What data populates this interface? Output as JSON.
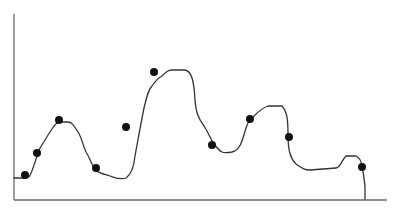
{
  "chart_data": {
    "type": "line",
    "title": "",
    "xlabel": "",
    "ylabel": "",
    "grid": false,
    "legend": null,
    "axis_ticks": false,
    "xlim": [
      0,
      373
    ],
    "ylim": [
      0,
      186
    ],
    "colors": {
      "line": "#333333",
      "points": "#111111",
      "axis": "#6b6b6b"
    },
    "line_series": {
      "name": "smooth curve",
      "x": [
        0,
        10,
        16,
        20,
        24,
        28,
        36,
        42,
        48,
        56,
        62,
        68,
        75,
        80,
        86,
        92,
        100,
        108,
        114,
        118,
        122,
        126,
        130,
        136,
        142,
        148,
        152,
        158,
        166,
        168,
        171,
        174,
        180,
        186,
        194,
        200,
        208,
        214,
        220,
        226,
        232,
        240,
        246,
        250,
        256,
        262,
        266,
        272,
        276,
        282,
        292,
        304,
        322,
        328,
        332,
        336,
        342,
        346,
        349,
        351,
        351
      ],
      "y": [
        22,
        22,
        24,
        34,
        52,
        58,
        74,
        76,
        76,
        70,
        58,
        42,
        36,
        30,
        28,
        26,
        28,
        40,
        72,
        90,
        100,
        106,
        110,
        114,
        114,
        114,
        110,
        80,
        68,
        64,
        60,
        60,
        56,
        52,
        46,
        46,
        60,
        76,
        82,
        84,
        82,
        76,
        72,
        72,
        62,
        46,
        36,
        30,
        28,
        28,
        30,
        32,
        38,
        36,
        34,
        32,
        30,
        26,
        20,
        10,
        0
      ]
    },
    "scatter_points": [
      {
        "x": 11,
        "y": 25
      },
      {
        "x": 23,
        "y": 47
      },
      {
        "x": 45,
        "y": 80
      },
      {
        "x": 82,
        "y": 32
      },
      {
        "x": 112,
        "y": 73
      },
      {
        "x": 140,
        "y": 128
      },
      {
        "x": 198,
        "y": 55
      },
      {
        "x": 236,
        "y": 81
      },
      {
        "x": 275,
        "y": 63
      },
      {
        "x": 348,
        "y": 33
      }
    ]
  }
}
